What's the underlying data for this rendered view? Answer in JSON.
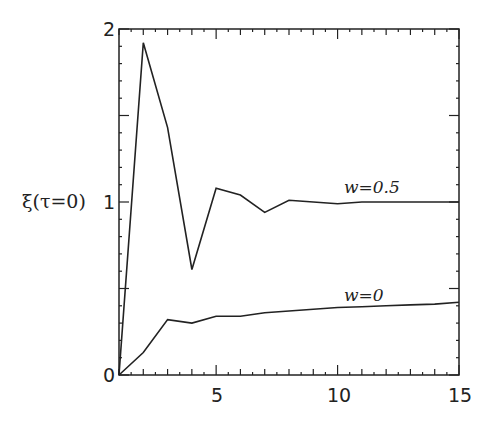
{
  "chart_data": {
    "type": "line",
    "title": "",
    "xlabel": "",
    "ylabel": "ξ(τ=0)",
    "xlim": [
      1,
      15
    ],
    "ylim": [
      0,
      2
    ],
    "grid": false,
    "legend": "inline labels",
    "x_ticks": [
      5,
      10,
      15
    ],
    "y_ticks": [
      0,
      1,
      2
    ],
    "series": [
      {
        "name": "w=0.5",
        "label_text": "w=0.5",
        "x": [
          1,
          2,
          3,
          4,
          5,
          6,
          7,
          8,
          9,
          10,
          11,
          12,
          13,
          14,
          15
        ],
        "values": [
          0.0,
          1.92,
          1.43,
          0.61,
          1.08,
          1.04,
          0.94,
          1.01,
          1.0,
          0.99,
          1.0,
          1.0,
          1.0,
          1.0,
          1.0
        ]
      },
      {
        "name": "w=0",
        "label_text": "w=0",
        "x": [
          1,
          2,
          3,
          4,
          5,
          6,
          7,
          8,
          9,
          10,
          11,
          12,
          13,
          14,
          15
        ],
        "values": [
          0.0,
          0.13,
          0.32,
          0.3,
          0.34,
          0.34,
          0.36,
          0.37,
          0.38,
          0.39,
          0.395,
          0.4,
          0.405,
          0.41,
          0.42
        ]
      }
    ]
  },
  "labels": {
    "ylabel": "ξ(τ=0)",
    "x_ticks": [
      "5",
      "10",
      "15"
    ],
    "y_ticks": [
      "0",
      "1",
      "2"
    ],
    "series_0": "w=0.5",
    "series_1": "w=0"
  }
}
